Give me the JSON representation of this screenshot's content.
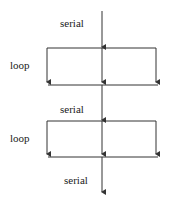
{
  "diagram": {
    "type": "flow",
    "labels": {
      "serial_1": "serial",
      "loop_1": "loop",
      "serial_2": "serial",
      "loop_2": "loop",
      "serial_3": "serial"
    },
    "colors": {
      "line": "#333333",
      "background": "#ffffff"
    }
  }
}
